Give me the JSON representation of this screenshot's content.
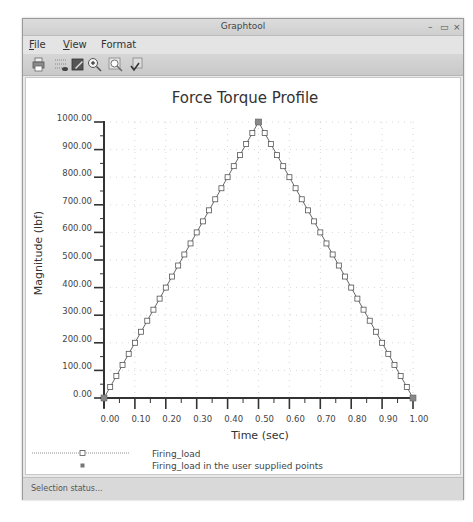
{
  "window": {
    "title": "Graphtool",
    "controls": {
      "minimize": "–",
      "maximize": "▭",
      "close": "×"
    }
  },
  "menubar": {
    "items": [
      {
        "label_u": "F",
        "label_rest": "ile"
      },
      {
        "label_u": "V",
        "label_rest": "iew"
      },
      {
        "label_u": "",
        "label_rest": "Format"
      }
    ]
  },
  "toolbar": {
    "icons": [
      "print-icon",
      "grid-view-icon",
      "edit-image-icon",
      "zoom-in-icon",
      "zoom-fit-icon",
      "apply-check-icon"
    ]
  },
  "statusbar": {
    "text": "Selection status..."
  },
  "colors": {
    "line": "#555555",
    "marker": "#555555",
    "grid": "#bbbbbb",
    "axis": "#333333"
  },
  "chart_data": {
    "type": "line",
    "title": "Force Torque Profile",
    "xlabel": "Time (sec)",
    "ylabel": "Magnitude (lbf)",
    "xlim": [
      0,
      1
    ],
    "ylim": [
      0,
      1000
    ],
    "x_ticks": [
      "0.00",
      "0.10",
      "0.20",
      "0.30",
      "0.40",
      "0.50",
      "0.60",
      "0.70",
      "0.80",
      "0.90",
      "1.00"
    ],
    "y_ticks": [
      "0.00",
      "100.00",
      "200.00",
      "300.00",
      "400.00",
      "500.00",
      "600.00",
      "700.00",
      "800.00",
      "900.00",
      "1000.00"
    ],
    "grid": true,
    "legend_position": "bottom",
    "series": [
      {
        "name": "Firing_load",
        "style": "line-with-open-square-markers",
        "x": [
          0.0,
          0.02,
          0.04,
          0.06,
          0.08,
          0.1,
          0.12,
          0.14,
          0.16,
          0.18,
          0.2,
          0.22,
          0.24,
          0.26,
          0.28,
          0.3,
          0.32,
          0.34,
          0.36,
          0.38,
          0.4,
          0.42,
          0.44,
          0.46,
          0.48,
          0.5,
          0.52,
          0.54,
          0.56,
          0.58,
          0.6,
          0.62,
          0.64,
          0.66,
          0.68,
          0.7,
          0.72,
          0.74,
          0.76,
          0.78,
          0.8,
          0.82,
          0.84,
          0.86,
          0.88,
          0.9,
          0.92,
          0.94,
          0.96,
          0.98,
          1.0
        ],
        "values": [
          0,
          40,
          80,
          120,
          160,
          200,
          240,
          280,
          320,
          360,
          400,
          440,
          480,
          520,
          560,
          600,
          640,
          680,
          720,
          760,
          800,
          840,
          880,
          920,
          960,
          1000,
          960,
          920,
          880,
          840,
          800,
          760,
          720,
          680,
          640,
          600,
          560,
          520,
          480,
          440,
          400,
          360,
          320,
          280,
          240,
          200,
          160,
          120,
          80,
          40,
          0
        ]
      },
      {
        "name": "Firing_load in the user supplied points",
        "style": "filled-square-markers",
        "x": [
          0.0,
          0.5,
          1.0
        ],
        "values": [
          0,
          1000,
          0
        ]
      }
    ]
  }
}
